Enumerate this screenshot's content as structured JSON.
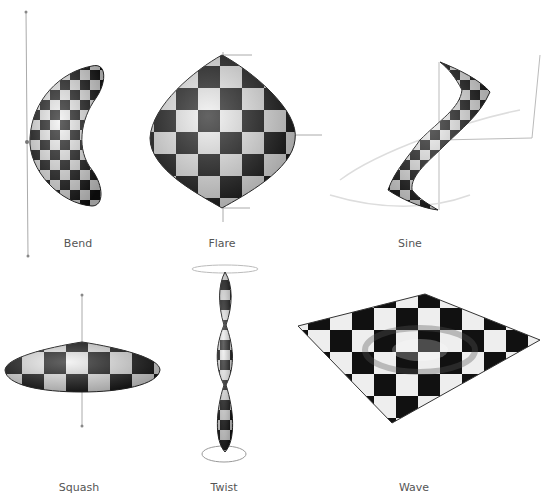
{
  "figure": {
    "panels": [
      {
        "id": "bend",
        "label": "Bend"
      },
      {
        "id": "flare",
        "label": "Flare"
      },
      {
        "id": "sine",
        "label": "Sine"
      },
      {
        "id": "squash",
        "label": "Squash"
      },
      {
        "id": "twist",
        "label": "Twist"
      },
      {
        "id": "wave",
        "label": "Wave"
      }
    ],
    "colors": {
      "checker_dark": "#111111",
      "checker_light": "#e8e8e8",
      "axis": "#999999",
      "caption": "#555555"
    }
  }
}
